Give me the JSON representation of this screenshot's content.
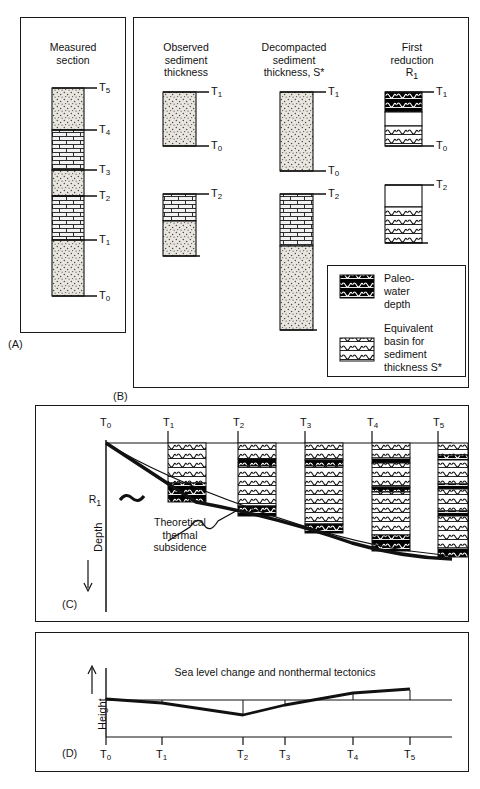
{
  "figure": {
    "panels": [
      {
        "id": "A",
        "label": "(A)",
        "title": "Measured\nsection"
      },
      {
        "id": "B",
        "label": "(B)"
      },
      {
        "id": "C",
        "label": "(C)"
      },
      {
        "id": "D",
        "label": "(D)"
      }
    ]
  },
  "panelA": {
    "label": "(A)",
    "title_lines": [
      "Measured",
      "section"
    ],
    "column": {
      "horizons": [
        "T_5",
        "T_4",
        "T_3",
        "T_2",
        "T_1",
        "T_0"
      ],
      "units": [
        {
          "pattern": "sand-dots",
          "from": "T_4",
          "to": "T_5"
        },
        {
          "pattern": "limestone-brick",
          "from": "T_3",
          "to": "T_4"
        },
        {
          "pattern": "sand-dots",
          "from": "T_2",
          "to": "T_3"
        },
        {
          "pattern": "limestone-brick",
          "from": "T_1",
          "to": "T_2"
        },
        {
          "pattern": "sand-dots",
          "from": "T_0",
          "to": "T_1"
        }
      ]
    },
    "tick_labels": [
      "T5",
      "T4",
      "T3",
      "T2",
      "T1",
      "T0"
    ]
  },
  "panelB": {
    "label": "(B)",
    "columns": [
      {
        "key": "observed",
        "title_lines": [
          "Observed",
          "sediment",
          "thickness"
        ]
      },
      {
        "key": "decompacted",
        "title_lines": [
          "Decompacted",
          "sediment",
          "thickness, S*"
        ]
      },
      {
        "key": "reduction",
        "title_lines": [
          "First",
          "reduction",
          "R1"
        ]
      }
    ],
    "row1": {
      "top_label": "T1",
      "bottom_label": "T0",
      "observed_pattern": "sand-dots",
      "decompacted_pattern": "sand-dots",
      "reduction_segments": [
        "paleo-water",
        "blank",
        "equivalent-basin"
      ]
    },
    "row2": {
      "top_label": "T2",
      "bottom_label": "",
      "observed_patterns": [
        "limestone-brick",
        "sand-dots"
      ],
      "decompacted_patterns": [
        "limestone-brick",
        "sand-dots"
      ],
      "reduction_segments": [
        "blank",
        "equivalent-basin"
      ]
    },
    "legend": {
      "items": [
        {
          "swatch": "paleo-water",
          "lines": [
            "Paleo-",
            "water",
            "depth"
          ]
        },
        {
          "swatch": "equivalent-basin",
          "lines": [
            "Equivalent",
            "basin for",
            "sediment",
            "thickness S*"
          ]
        }
      ]
    }
  },
  "panelC": {
    "label": "(C)",
    "y_axis_label": "Depth",
    "y_axis_arrow": "↓",
    "time_labels": [
      "T0",
      "T1",
      "T2",
      "T3",
      "T4",
      "T5"
    ],
    "annotations": [
      {
        "name": "r1-label",
        "text": "R1"
      },
      {
        "name": "theoretical-label",
        "lines": [
          "Theoretical",
          "thermal",
          "subsidence"
        ]
      }
    ],
    "chart_data": {
      "type": "line",
      "title": "",
      "xlabel": "",
      "ylabel": "Depth",
      "x": [
        "T0",
        "T1",
        "T2",
        "T3",
        "T4",
        "T5"
      ],
      "series": [
        {
          "name": "R1 basement subsidence",
          "values": [
            0,
            74,
            96,
            110,
            146,
            152
          ]
        },
        {
          "name": "Theoretical thermal subsidence",
          "values": [
            0,
            60,
            92,
            112,
            140,
            150
          ]
        }
      ],
      "columns": [
        {
          "t": "T1",
          "top": 0,
          "bottom": 74,
          "bands": [
            {
              "type": "equivalent-basin",
              "from": 0,
              "to": 50
            },
            {
              "type": "paleo-water",
              "from": 50,
              "to": 74
            }
          ]
        },
        {
          "t": "T2",
          "top": 0,
          "bottom": 96,
          "bands": [
            {
              "type": "equivalent-basin",
              "from": 0,
              "to": 20
            },
            {
              "type": "paleo-water",
              "from": 20,
              "to": 28
            },
            {
              "type": "equivalent-basin",
              "from": 28,
              "to": 84
            },
            {
              "type": "paleo-water",
              "from": 84,
              "to": 96
            }
          ]
        },
        {
          "t": "T3",
          "top": 0,
          "bottom": 112,
          "bands": [
            {
              "type": "equivalent-basin",
              "from": 0,
              "to": 22
            },
            {
              "type": "paleo-water",
              "from": 22,
              "to": 28
            },
            {
              "type": "equivalent-basin",
              "from": 28,
              "to": 100
            },
            {
              "type": "paleo-water",
              "from": 100,
              "to": 112
            }
          ]
        },
        {
          "t": "T4",
          "top": 0,
          "bottom": 148,
          "bands": [
            {
              "type": "equivalent-basin",
              "from": 0,
              "to": 24
            },
            {
              "type": "paleo-water",
              "from": 24,
              "to": 30
            },
            {
              "type": "equivalent-basin",
              "from": 30,
              "to": 70
            },
            {
              "type": "paleo-water",
              "from": 70,
              "to": 76
            },
            {
              "type": "equivalent-basin",
              "from": 76,
              "to": 126
            },
            {
              "type": "paleo-water",
              "from": 126,
              "to": 148
            }
          ]
        },
        {
          "t": "T5",
          "top": 0,
          "bottom": 156,
          "bands": [
            {
              "type": "equivalent-basin",
              "from": 0,
              "to": 18
            },
            {
              "type": "paleo-water",
              "from": 18,
              "to": 24
            },
            {
              "type": "equivalent-basin",
              "from": 24,
              "to": 60
            },
            {
              "type": "paleo-water",
              "from": 60,
              "to": 66
            },
            {
              "type": "equivalent-basin",
              "from": 66,
              "to": 96
            },
            {
              "type": "paleo-water",
              "from": 96,
              "to": 102
            },
            {
              "type": "equivalent-basin",
              "from": 102,
              "to": 148
            },
            {
              "type": "paleo-water",
              "from": 148,
              "to": 156
            }
          ]
        }
      ]
    }
  },
  "panelD": {
    "label": "(D)",
    "title": "Sea level change and nonthermal tectonics",
    "y_axis_label": "Height",
    "y_axis_arrow": "↑",
    "chart_data": {
      "type": "line",
      "title": "Sea level change and nonthermal tectonics",
      "xlabel": "",
      "ylabel": "Height",
      "categories": [
        "T0",
        "T1",
        "T2",
        "T3",
        "T4",
        "T5"
      ],
      "values": [
        0,
        -4,
        -20,
        -7,
        7,
        12
      ],
      "baseline": 0,
      "grid": false
    },
    "tick_labels": [
      "T0",
      "T1",
      "T2",
      "T3",
      "T4",
      "T5"
    ]
  },
  "colors": {
    "ink": "#111111",
    "border": "#1a1a1a",
    "paleo_water_fill": "#000000",
    "basin_fill": "#ffffff",
    "sand_fill": "#e9e6e0",
    "brick_fill": "#efefef"
  }
}
